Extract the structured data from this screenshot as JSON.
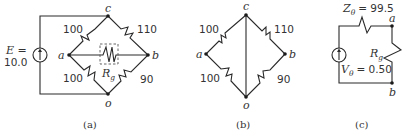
{
  "diagram_a": {
    "caption": "(a)",
    "source_label_line1": "E =",
    "source_value": "10.0",
    "nodes": {
      "a": "a",
      "b": "b",
      "c": "c",
      "o": "o"
    },
    "resistors": {
      "ac": "100",
      "cb": "110",
      "ao": "100",
      "ob": "90"
    },
    "galvanometer_label": "R",
    "galvanometer_sub": "g"
  },
  "diagram_b": {
    "caption": "(b)",
    "nodes": {
      "a": "a",
      "b": "b",
      "c": "c",
      "o": "o"
    },
    "resistors": {
      "ac": "100",
      "cb": "110",
      "ao": "100",
      "ob": "90"
    }
  },
  "diagram_c": {
    "caption": "(c)",
    "thevenin_impedance_label": "Z",
    "thevenin_impedance_sub": "θ",
    "thevenin_impedance_value": "= 99.5",
    "thevenin_voltage_label": "V",
    "thevenin_voltage_sub": "θ",
    "thevenin_voltage_value": "= 0.50",
    "load_label": "R",
    "load_sub": "g",
    "nodes": {
      "a": "a",
      "b": "b"
    }
  }
}
